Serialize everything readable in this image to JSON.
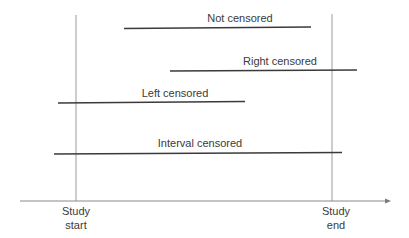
{
  "diagram": {
    "type": "censoring-timeline",
    "axis": {
      "start_label_line1": "Study",
      "start_label_line2": "start",
      "end_label_line1": "Study",
      "end_label_line2": "end"
    },
    "segments": [
      {
        "id": "not-censored",
        "label": "Not censored",
        "x1": 124,
        "x2": 311,
        "y": 28
      },
      {
        "id": "right-censored",
        "label": "Right censored",
        "x1": 170,
        "x2": 357,
        "y": 70
      },
      {
        "id": "left-censored",
        "label": "Left censored",
        "x1": 58,
        "x2": 245,
        "y": 102
      },
      {
        "id": "interval-censored",
        "label": "Interval censored",
        "x1": 54,
        "x2": 342,
        "y": 153
      }
    ],
    "colors": {
      "segment": "#3a3a3a",
      "guide": "#9a9a9a",
      "axis": "#8a8a8a"
    }
  }
}
